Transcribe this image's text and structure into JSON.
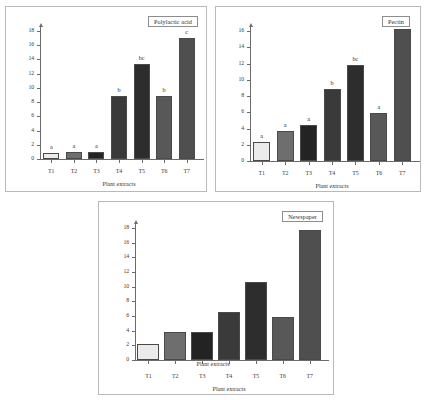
{
  "figure": {
    "background_color": "#ffffff",
    "panel_border_color": "#b9b9b9"
  },
  "palette": {
    "bar_t1": "#ebebeb",
    "bar_t2": "#6e6e6e",
    "bar_t3": "#232323",
    "bar_t4": "#3a3a3a",
    "bar_t5": "#2d2d2d",
    "bar_t6": "#585858",
    "bar_t7": "#4f4f4f",
    "axis": "#6b6b6b",
    "text": "#343434"
  },
  "chart_data": [
    {
      "type": "bar",
      "title": "Polylactic acid",
      "panel_id": "panel-pla",
      "xlabel": "Plant extracts",
      "ylabel": "",
      "categories": [
        "T1",
        "T2",
        "T3",
        "T4",
        "T5",
        "T6",
        "T7"
      ],
      "values": [
        0.8,
        1.0,
        1.0,
        8.9,
        13.3,
        8.9,
        17.0
      ],
      "annotations": [
        "a",
        "a",
        "a",
        "b",
        "bc",
        "b",
        "c"
      ],
      "ylim": [
        0,
        18
      ],
      "yticks": [
        0,
        2,
        4,
        6,
        8,
        10,
        12,
        14,
        16,
        18
      ],
      "ytick_labels": [
        "0",
        "2",
        "4",
        "6",
        "8",
        "10",
        "12",
        "14",
        "16",
        "18"
      ],
      "grid": false,
      "legend": "none"
    },
    {
      "type": "bar",
      "title": "Pectin",
      "panel_id": "panel-pec",
      "xlabel": "Plant extracts",
      "ylabel": "",
      "categories": [
        "T1",
        "T2",
        "T3",
        "T4",
        "T5",
        "T6",
        "T7"
      ],
      "values": [
        2.3,
        3.7,
        4.4,
        8.9,
        11.8,
        5.9,
        16.3
      ],
      "annotations": [
        "a",
        "a",
        "a",
        "b",
        "bc",
        "a",
        "c"
      ],
      "ylim": [
        0,
        16
      ],
      "yticks": [
        0,
        2,
        4,
        6,
        8,
        10,
        12,
        14,
        16
      ],
      "ytick_labels": [
        "0",
        "2",
        "4",
        "6",
        "8",
        "10",
        "12",
        "14",
        "16"
      ],
      "grid": false,
      "legend": "none"
    },
    {
      "type": "bar",
      "title": "Newspaper",
      "panel_id": "panel-new",
      "xlabel": "Plant extracts",
      "xlabel_overlap": "Plant extracts",
      "ylabel": "",
      "categories": [
        "T1",
        "T2",
        "T3",
        "T4",
        "T5",
        "T6",
        "T7"
      ],
      "values": [
        2.2,
        3.8,
        3.8,
        6.6,
        10.7,
        5.9,
        17.7
      ],
      "annotations": [
        "",
        "",
        "",
        "",
        "",
        "",
        ""
      ],
      "ylim": [
        0,
        18
      ],
      "yticks": [
        0,
        2,
        4,
        6,
        8,
        10,
        12,
        14,
        16,
        18
      ],
      "ytick_labels": [
        "0",
        "2",
        "4",
        "6",
        "8",
        "10",
        "12",
        "14",
        "16",
        "18"
      ],
      "grid": false,
      "legend": "none"
    }
  ]
}
